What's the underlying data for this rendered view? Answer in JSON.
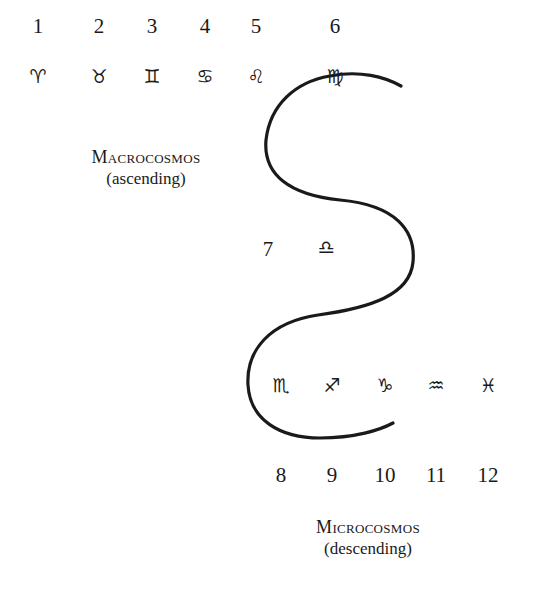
{
  "diagram": {
    "signs": [
      {
        "number": "1",
        "symbol": "♈",
        "name": "aries",
        "x": 38,
        "num_y": 16,
        "sym_y": 67
      },
      {
        "number": "2",
        "symbol": "♉",
        "name": "taurus",
        "x": 99,
        "num_y": 16,
        "sym_y": 67
      },
      {
        "number": "3",
        "symbol": "♊",
        "name": "gemini",
        "x": 152,
        "num_y": 16,
        "sym_y": 67
      },
      {
        "number": "4",
        "symbol": "♋",
        "name": "cancer",
        "x": 205,
        "num_y": 16,
        "sym_y": 67
      },
      {
        "number": "5",
        "symbol": "♌",
        "name": "leo",
        "x": 256,
        "num_y": 16,
        "sym_y": 67
      },
      {
        "number": "6",
        "symbol": "♍",
        "name": "virgo",
        "x": 335,
        "num_y": 16,
        "sym_y": 67
      },
      {
        "number": "7",
        "symbol": "♎",
        "name": "libra",
        "x": 268,
        "num_y": 239,
        "sym_x": 325,
        "sym_y": 239
      },
      {
        "number": "8",
        "symbol": "♏",
        "name": "scorpio",
        "x": 281,
        "num_y": 465,
        "sym_y": 375
      },
      {
        "number": "9",
        "symbol": "♐",
        "name": "sagittarius",
        "x": 332,
        "num_y": 465,
        "sym_y": 375
      },
      {
        "number": "10",
        "symbol": "♑",
        "name": "capricorn",
        "x": 385,
        "num_y": 465,
        "sym_y": 375
      },
      {
        "number": "11",
        "symbol": "♒",
        "name": "aquarius",
        "x": 436,
        "num_y": 465,
        "sym_y": 375
      },
      {
        "number": "12",
        "symbol": "♓",
        "name": "pisces",
        "x": 488,
        "num_y": 465,
        "sym_y": 375
      }
    ],
    "macrocosmos": {
      "title": "Macrocosmos",
      "subtitle": "(ascending)"
    },
    "microcosmos": {
      "title": "Microcosmos",
      "subtitle": "(descending)"
    },
    "curve": {
      "color": "#1a1a1a",
      "stroke_width": 3.2,
      "path": "M 401 86 C 385 77, 360 70, 330 76 C 295 82, 270 105, 266 140 C 263 175, 290 195, 340 200 C 395 205, 416 230, 413 262 C 410 295, 370 308, 318 315 C 270 322, 246 350, 248 385 C 250 420, 280 438, 320 438 C 355 438, 380 430, 393 423"
    }
  }
}
